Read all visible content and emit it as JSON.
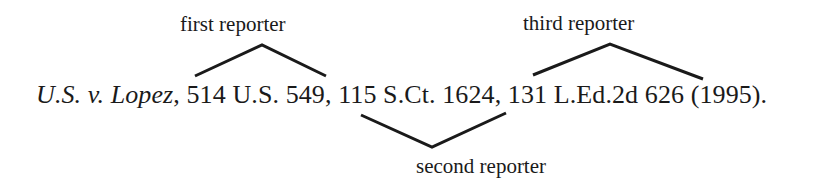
{
  "labels": {
    "first": "first reporter",
    "second": "second reporter",
    "third": "third reporter"
  },
  "citation": {
    "case_name": "U.S. v. Lopez",
    "after_case_name": ", ",
    "first_reporter": "514 U.S. 549",
    "sep1": ", ",
    "second_reporter": "115 S.Ct. 1624",
    "sep2": ", ",
    "third_reporter": "131 L.Ed.2d 626",
    "year": " (1995)."
  },
  "colors": {
    "ink": "#1a1a1a",
    "background": "#ffffff"
  }
}
